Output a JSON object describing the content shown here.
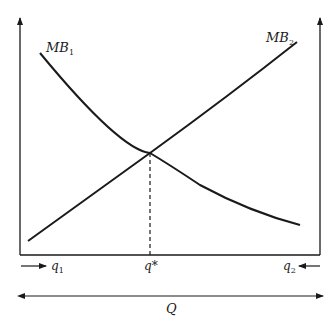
{
  "diagram": {
    "type": "marginal-benefit-allocation",
    "curves": [
      {
        "name": "MB",
        "subscript": "1",
        "shape": "downward-sloping, convex"
      },
      {
        "name": "MB",
        "subscript": "2",
        "shape": "upward-sloping (measured from right axis)"
      }
    ],
    "intersection_label": "q*",
    "left_label": {
      "text": "q",
      "subscript": "1",
      "arrow": "right"
    },
    "right_label": {
      "text": "q",
      "subscript": "2",
      "arrow": "left"
    },
    "total_label": "Q",
    "colors": {
      "line": "#1a1a1a",
      "background": "#ffffff"
    }
  }
}
